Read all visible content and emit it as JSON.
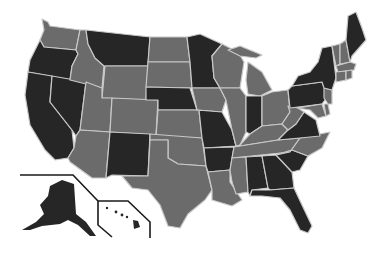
{
  "map": {
    "title": "United States map (two-tone)",
    "colors": {
      "dark": "#262626",
      "gray": "#6b6b6b",
      "border": "#c8c8c8",
      "background": "#ffffff"
    },
    "states": {
      "WA": "gray",
      "OR": "dark",
      "CA": "dark",
      "NV": "dark",
      "ID": "gray",
      "MT": "dark",
      "WY": "gray",
      "UT": "gray",
      "CO": "gray",
      "AZ": "gray",
      "NM": "dark",
      "ND": "gray",
      "SD": "gray",
      "NE": "dark",
      "KS": "gray",
      "OK": "gray",
      "TX": "gray",
      "MN": "dark",
      "IA": "gray",
      "MO": "dark",
      "AR": "dark",
      "LA": "gray",
      "WI": "gray",
      "IL": "gray",
      "MI": "gray",
      "IN": "dark",
      "OH": "gray",
      "KY": "gray",
      "TN": "gray",
      "MS": "gray",
      "AL": "dark",
      "GA": "dark",
      "FL": "dark",
      "SC": "dark",
      "NC": "gray",
      "VA": "dark",
      "WV": "gray",
      "PA": "dark",
      "NY": "dark",
      "VT": "gray",
      "NH": "gray",
      "ME": "dark",
      "MA": "gray",
      "CT": "gray",
      "RI": "gray",
      "NJ": "gray",
      "DE": "gray",
      "MD": "gray",
      "AK": "dark",
      "HI": "dark"
    }
  }
}
